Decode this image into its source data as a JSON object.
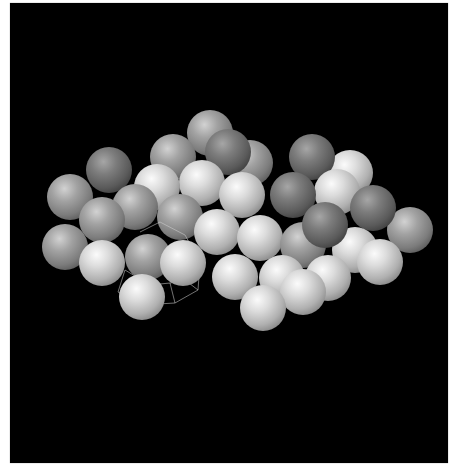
{
  "scene": {
    "description": "3D rendered cluster of grayscale spheres on black background",
    "background": "#000000",
    "frame_border": "#ffffff",
    "tones": {
      "dark": "#5a5a5a",
      "mid": "#8a8a8a",
      "light": "#d0d0d0"
    },
    "sphere_radius": 23,
    "spheres": [
      {
        "x": 210,
        "y": 133,
        "tone": "mid"
      },
      {
        "x": 173,
        "y": 157,
        "tone": "mid"
      },
      {
        "x": 250,
        "y": 163,
        "tone": "mid"
      },
      {
        "x": 228,
        "y": 152,
        "tone": "dark"
      },
      {
        "x": 312,
        "y": 157,
        "tone": "dark"
      },
      {
        "x": 350,
        "y": 173,
        "tone": "light"
      },
      {
        "x": 109,
        "y": 170,
        "tone": "dark"
      },
      {
        "x": 70,
        "y": 197,
        "tone": "mid"
      },
      {
        "x": 157,
        "y": 187,
        "tone": "light"
      },
      {
        "x": 202,
        "y": 183,
        "tone": "light"
      },
      {
        "x": 242,
        "y": 195,
        "tone": "light"
      },
      {
        "x": 337,
        "y": 192,
        "tone": "light"
      },
      {
        "x": 102,
        "y": 220,
        "tone": "mid"
      },
      {
        "x": 410,
        "y": 230,
        "tone": "mid"
      },
      {
        "x": 293,
        "y": 195,
        "tone": "dark"
      },
      {
        "x": 373,
        "y": 208,
        "tone": "dark"
      },
      {
        "x": 180,
        "y": 217,
        "tone": "mid"
      },
      {
        "x": 135,
        "y": 207,
        "tone": "mid"
      },
      {
        "x": 217,
        "y": 232,
        "tone": "light"
      },
      {
        "x": 260,
        "y": 238,
        "tone": "light"
      },
      {
        "x": 303,
        "y": 245,
        "tone": "mid"
      },
      {
        "x": 355,
        "y": 250,
        "tone": "light"
      },
      {
        "x": 380,
        "y": 262,
        "tone": "light"
      },
      {
        "x": 325,
        "y": 225,
        "tone": "dark"
      },
      {
        "x": 65,
        "y": 247,
        "tone": "mid"
      },
      {
        "x": 183,
        "y": 263,
        "tone": "light"
      },
      {
        "x": 142,
        "y": 297,
        "tone": "light"
      },
      {
        "x": 102,
        "y": 263,
        "tone": "light"
      },
      {
        "x": 148,
        "y": 257,
        "tone": "mid"
      },
      {
        "x": 303,
        "y": 292,
        "tone": "light"
      },
      {
        "x": 263,
        "y": 308,
        "tone": "light"
      },
      {
        "x": 235,
        "y": 277,
        "tone": "light"
      },
      {
        "x": 282,
        "y": 278,
        "tone": "light"
      },
      {
        "x": 328,
        "y": 278,
        "tone": "light"
      }
    ],
    "wireframe": {
      "color": "#cfcfcf",
      "segments": [
        [
          118,
          292,
          140,
          305
        ],
        [
          140,
          305,
          175,
          303
        ],
        [
          175,
          303,
          198,
          290
        ],
        [
          198,
          290,
          200,
          262
        ],
        [
          200,
          262,
          185,
          235
        ],
        [
          185,
          235,
          160,
          222
        ],
        [
          118,
          292,
          125,
          270
        ],
        [
          140,
          305,
          150,
          285
        ],
        [
          175,
          303,
          170,
          283
        ],
        [
          198,
          290,
          185,
          280
        ],
        [
          150,
          285,
          170,
          283
        ],
        [
          170,
          283,
          185,
          280
        ],
        [
          125,
          270,
          150,
          285
        ],
        [
          185,
          280,
          200,
          262
        ],
        [
          160,
          222,
          140,
          232
        ]
      ]
    }
  }
}
